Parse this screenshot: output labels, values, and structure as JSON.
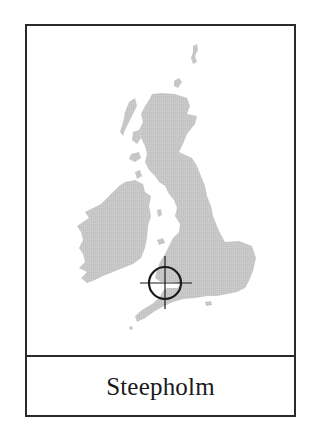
{
  "card": {
    "place_name": "Steepholm",
    "map_region": "British Isles",
    "marker": {
      "icon": "crosshair-target-icon",
      "x": 165,
      "y": 283
    }
  },
  "colors": {
    "border": "#2a2a2a",
    "land": "#c8c8c8",
    "marker": "#1a1a1a",
    "background": "#ffffff",
    "text": "#1a1a1a"
  }
}
